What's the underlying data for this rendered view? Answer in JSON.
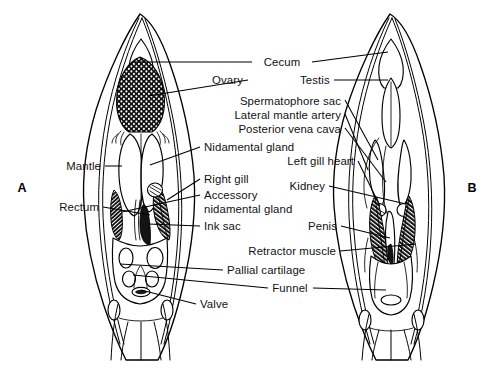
{
  "figure": {
    "background_color": "#ffffff",
    "ink_color": "#000000",
    "panels": [
      {
        "id": "A",
        "label": "A",
        "sex": "female"
      },
      {
        "id": "B",
        "label": "B",
        "sex": "male"
      }
    ]
  },
  "labels": {
    "cecum": "Cecum",
    "ovary": "Ovary",
    "testis": "Testis",
    "spermatophore_sac": "Spermatophore sac",
    "lateral_mantle_artery": "Lateral mantle artery",
    "posterior_vena_cava": "Posterior vena cava",
    "nidamental_gland": "Nidamental gland",
    "left_gill_heart": "Left gill heart",
    "mantle": "Mantle",
    "right_gill": "Right gill",
    "kidney": "Kidney",
    "accessory_line1": "Accessory",
    "accessory_line2": "nidamental gland",
    "rectum": "Rectum",
    "ink_sac": "Ink sac",
    "penis": "Penis",
    "retractor_muscle": "Retractor muscle",
    "pallial_cartilage": "Pallial cartilage",
    "funnel": "Funnel",
    "valve": "Valve",
    "panel_a": "A",
    "panel_b": "B"
  },
  "callouts": [
    {
      "name": "cecum",
      "text": "Cecum",
      "x": 282,
      "y": 62,
      "anchor": "middle",
      "targets": [
        "A",
        "B"
      ]
    },
    {
      "name": "ovary",
      "text": "Ovary",
      "x": 243,
      "y": 80,
      "anchor": "end",
      "targets": [
        "A"
      ]
    },
    {
      "name": "testis",
      "text": "Testis",
      "x": 300,
      "y": 80,
      "anchor": "start",
      "targets": [
        "B"
      ]
    },
    {
      "name": "spermatophore-sac",
      "text": "Spermatophore sac",
      "x": 341,
      "y": 101,
      "anchor": "end",
      "targets": [
        "B"
      ]
    },
    {
      "name": "lateral-mantle-artery",
      "text": "Lateral mantle artery",
      "x": 341,
      "y": 115,
      "anchor": "end",
      "targets": [
        "B"
      ]
    },
    {
      "name": "posterior-vena-cava",
      "text": "Posterior vena cava",
      "x": 341,
      "y": 129,
      "anchor": "end",
      "targets": [
        "B"
      ]
    },
    {
      "name": "nidamental-gland",
      "text": "Nidamental gland",
      "x": 204,
      "y": 147,
      "anchor": "start",
      "targets": [
        "A"
      ]
    },
    {
      "name": "left-gill-heart",
      "text": "Left gill heart",
      "x": 354,
      "y": 161,
      "anchor": "end",
      "targets": [
        "B"
      ]
    },
    {
      "name": "mantle",
      "text": "Mantle",
      "x": 101,
      "y": 166,
      "anchor": "end",
      "targets": [
        "A"
      ]
    },
    {
      "name": "right-gill",
      "text": "Right gill",
      "x": 204,
      "y": 179,
      "anchor": "start",
      "targets": [
        "A"
      ]
    },
    {
      "name": "kidney",
      "text": "Kidney",
      "x": 325,
      "y": 186,
      "anchor": "end",
      "targets": [
        "B"
      ]
    },
    {
      "name": "accessory-nidamental-gland",
      "text": "Accessory",
      "x": 204,
      "y": 195,
      "anchor": "start",
      "targets": [
        "A"
      ]
    },
    {
      "name": "accessory-nidamental-gland-2",
      "text": "nidamental gland",
      "x": 204,
      "y": 209,
      "anchor": "start",
      "targets": [
        "A"
      ]
    },
    {
      "name": "rectum",
      "text": "Rectum",
      "x": 99,
      "y": 207,
      "anchor": "end",
      "targets": [
        "A"
      ]
    },
    {
      "name": "ink-sac",
      "text": "Ink sac",
      "x": 204,
      "y": 226,
      "anchor": "start",
      "targets": [
        "A"
      ]
    },
    {
      "name": "penis",
      "text": "Penis",
      "x": 337,
      "y": 226,
      "anchor": "end",
      "targets": [
        "B"
      ]
    },
    {
      "name": "retractor-muscle",
      "text": "Retractor muscle",
      "x": 336,
      "y": 251,
      "anchor": "end",
      "targets": [
        "B"
      ]
    },
    {
      "name": "pallial-cartilage",
      "text": "Pallial cartilage",
      "x": 227,
      "y": 270,
      "anchor": "start",
      "targets": [
        "A"
      ]
    },
    {
      "name": "funnel",
      "text": "Funnel",
      "x": 290,
      "y": 288,
      "anchor": "middle",
      "targets": [
        "A",
        "B"
      ]
    },
    {
      "name": "valve",
      "text": "Valve",
      "x": 200,
      "y": 304,
      "anchor": "start",
      "targets": [
        "A"
      ]
    }
  ],
  "panel_markers": [
    {
      "name": "panel-marker-a",
      "text": "A",
      "x": 22,
      "y": 188
    },
    {
      "name": "panel-marker-b",
      "text": "B",
      "x": 472,
      "y": 188
    }
  ]
}
